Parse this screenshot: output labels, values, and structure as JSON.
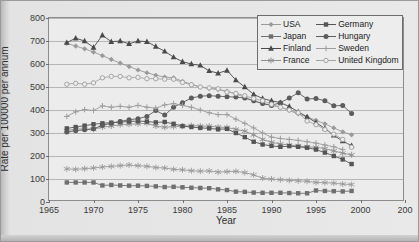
{
  "chart_data": {
    "type": "line",
    "title": "",
    "xlabel": "Year",
    "ylabel": "Rate per 100000 per annum",
    "xlim": [
      1965,
      2005
    ],
    "ylim": [
      0,
      800
    ],
    "xticks": [
      1965,
      1970,
      1975,
      1980,
      1985,
      1990,
      1995,
      2000,
      2005
    ],
    "xtick_labels": [
      "1965",
      "1970",
      "1975",
      "1980",
      "1985",
      "1990",
      "1995",
      "2000",
      "200"
    ],
    "yticks": [
      0,
      100,
      200,
      300,
      400,
      500,
      600,
      700,
      800
    ],
    "ytick_labels": [
      "0",
      "100",
      "200",
      "300",
      "400",
      "500",
      "600",
      "700",
      "800"
    ],
    "grid": true,
    "legend_position": "top-right",
    "legend_columns": 2,
    "series": [
      {
        "name": "USA",
        "marker": "diamond",
        "color": "#9a9a9a",
        "x": [
          1967,
          1968,
          1969,
          1970,
          1971,
          1972,
          1973,
          1974,
          1975,
          1976,
          1977,
          1978,
          1979,
          1980,
          1981,
          1982,
          1983,
          1984,
          1985,
          1986,
          1987,
          1988,
          1989,
          1990,
          1991,
          1992,
          1993,
          1994,
          1995,
          1996,
          1997,
          1998,
          1999
        ],
        "y": [
          690,
          678,
          666,
          652,
          636,
          620,
          604,
          589,
          574,
          562,
          551,
          543,
          540,
          525,
          512,
          500,
          493,
          489,
          482,
          470,
          455,
          440,
          428,
          420,
          412,
          398,
          383,
          370,
          355,
          340,
          322,
          305,
          292
        ]
      },
      {
        "name": "Japan",
        "marker": "square",
        "color": "#6f6f6f",
        "x": [
          1967,
          1968,
          1969,
          1970,
          1971,
          1972,
          1973,
          1974,
          1975,
          1976,
          1977,
          1978,
          1979,
          1980,
          1981,
          1982,
          1983,
          1984,
          1985,
          1986,
          1987,
          1988,
          1989,
          1990,
          1991,
          1992,
          1993,
          1994,
          1995,
          1996,
          1997,
          1998,
          1999
        ],
        "y": [
          85,
          85,
          85,
          85,
          72,
          74,
          72,
          71,
          71,
          70,
          68,
          65,
          66,
          64,
          62,
          61,
          60,
          55,
          52,
          45,
          44,
          41,
          40,
          40,
          40,
          39,
          38,
          38,
          50,
          48,
          47,
          46,
          48
        ]
      },
      {
        "name": "Finland",
        "marker": "triangle",
        "color": "#4a4a4a",
        "x": [
          1967,
          1968,
          1969,
          1970,
          1971,
          1972,
          1973,
          1974,
          1975,
          1976,
          1977,
          1978,
          1979,
          1980,
          1981,
          1982,
          1983,
          1984,
          1985,
          1986,
          1987,
          1988,
          1989,
          1990,
          1991,
          1992,
          1993,
          1994,
          1995,
          1996,
          1997,
          1998,
          1999
        ],
        "y": [
          693,
          712,
          700,
          672,
          725,
          697,
          700,
          688,
          700,
          697,
          676,
          655,
          630,
          610,
          600,
          594,
          570,
          560,
          572,
          530,
          500,
          468,
          450,
          440,
          432,
          415,
          392,
          370,
          345,
          320,
          290,
          265,
          245
        ]
      },
      {
        "name": "France",
        "marker": "star",
        "color": "#8f8f8f",
        "x": [
          1967,
          1968,
          1969,
          1970,
          1971,
          1972,
          1973,
          1974,
          1975,
          1976,
          1977,
          1978,
          1979,
          1980,
          1981,
          1982,
          1983,
          1984,
          1985,
          1986,
          1987,
          1988,
          1989,
          1990,
          1991,
          1992,
          1993,
          1994,
          1995,
          1996,
          1997,
          1998,
          1999
        ],
        "y": [
          310,
          318,
          318,
          316,
          326,
          330,
          336,
          338,
          340,
          342,
          330,
          325,
          328,
          330,
          332,
          330,
          330,
          326,
          324,
          316,
          308,
          292,
          272,
          260,
          252,
          248,
          244,
          240,
          238,
          232,
          222,
          212,
          205
        ]
      },
      {
        "name": "Germany",
        "marker": "square",
        "color": "#555555",
        "x": [
          1967,
          1968,
          1969,
          1970,
          1971,
          1972,
          1973,
          1974,
          1975,
          1976,
          1977,
          1978,
          1979,
          1980,
          1981,
          1982,
          1983,
          1984,
          1985,
          1986,
          1987,
          1988,
          1989,
          1990,
          1991,
          1992,
          1993,
          1994,
          1995,
          1996,
          1997,
          1998,
          1999
        ],
        "y": [
          320,
          326,
          332,
          338,
          342,
          345,
          348,
          350,
          352,
          350,
          346,
          348,
          340,
          330,
          326,
          322,
          320,
          316,
          318,
          300,
          282,
          262,
          250,
          244,
          240,
          243,
          240,
          236,
          228,
          215,
          200,
          185,
          165
        ]
      },
      {
        "name": "Hungary",
        "marker": "circle",
        "color": "#5c5c5c",
        "x": [
          1967,
          1968,
          1969,
          1970,
          1971,
          1972,
          1973,
          1974,
          1975,
          1976,
          1977,
          1978,
          1979,
          1980,
          1981,
          1982,
          1983,
          1984,
          1985,
          1986,
          1987,
          1988,
          1989,
          1990,
          1991,
          1992,
          1993,
          1994,
          1995,
          1996,
          1997,
          1998,
          1999
        ],
        "y": [
          304,
          310,
          314,
          318,
          334,
          342,
          350,
          358,
          362,
          372,
          398,
          378,
          412,
          432,
          452,
          460,
          462,
          460,
          458,
          456,
          452,
          440,
          428,
          420,
          432,
          452,
          475,
          448,
          450,
          440,
          418,
          420,
          385
        ]
      },
      {
        "name": "Sweden",
        "marker": "plus",
        "color": "#9d9d9d",
        "x": [
          1967,
          1968,
          1969,
          1970,
          1971,
          1972,
          1973,
          1974,
          1975,
          1976,
          1977,
          1978,
          1979,
          1980,
          1981,
          1982,
          1983,
          1984,
          1985,
          1986,
          1987,
          1988,
          1989,
          1990,
          1991,
          1992,
          1993,
          1994,
          1995,
          1996,
          1997,
          1998
        ],
        "y": [
          372,
          392,
          402,
          398,
          418,
          412,
          416,
          412,
          420,
          412,
          408,
          422,
          428,
          420,
          412,
          400,
          388,
          380,
          380,
          360,
          342,
          322,
          300,
          282,
          276,
          272,
          268,
          262,
          256,
          248,
          240,
          228
        ]
      },
      {
        "name": "United Kingdom",
        "marker": "open-circle",
        "color": "#a5a5a5",
        "x": [
          1967,
          1968,
          1969,
          1970,
          1971,
          1972,
          1973,
          1974,
          1975,
          1976,
          1977,
          1978,
          1979,
          1980,
          1981,
          1982,
          1983,
          1984,
          1985,
          1986,
          1987,
          1988,
          1989,
          1990,
          1991,
          1992,
          1993,
          1994,
          1995,
          1996,
          1997,
          1998,
          1999
        ],
        "y": [
          512,
          516,
          512,
          518,
          540,
          546,
          546,
          540,
          542,
          536,
          536,
          534,
          534,
          520,
          510,
          500,
          496,
          492,
          478,
          472,
          462,
          450,
          440,
          425,
          412,
          400,
          388,
          352,
          336,
          315,
          295,
          272,
          238
        ]
      },
      {
        "name": "Sweden-low",
        "marker": "star",
        "color": "#9a9a9a",
        "x": [
          1967,
          1968,
          1969,
          1970,
          1971,
          1972,
          1973,
          1974,
          1975,
          1976,
          1977,
          1978,
          1979,
          1980,
          1981,
          1982,
          1983,
          1984,
          1985,
          1986,
          1987,
          1988,
          1989,
          1990,
          1991,
          1992,
          1993,
          1994,
          1995,
          1996,
          1997,
          1998,
          1999
        ],
        "y": [
          144,
          142,
          145,
          148,
          152,
          155,
          158,
          161,
          158,
          155,
          150,
          148,
          142,
          140,
          136,
          134,
          135,
          130,
          132,
          133,
          128,
          118,
          104,
          100,
          97,
          94,
          92,
          90,
          85,
          84,
          82,
          78,
          76
        ]
      }
    ]
  }
}
